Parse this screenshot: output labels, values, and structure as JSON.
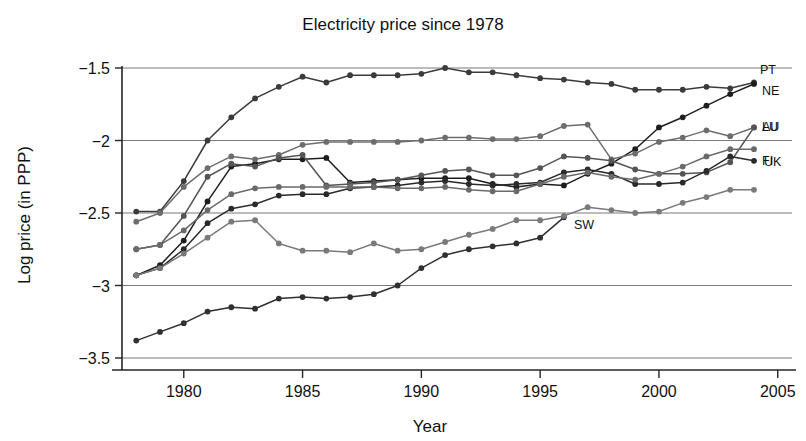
{
  "chart_data": {
    "type": "line",
    "title": "Electricity price since 1978",
    "xlabel": "Year",
    "ylabel": "Log price (in PPP)",
    "xlim": [
      1977.4,
      2005.6
    ],
    "ylim": [
      -3.62,
      -1.46
    ],
    "xticks": [
      1980,
      1985,
      1990,
      1995,
      2000,
      2005
    ],
    "xtick_labels": [
      "1980",
      "1985",
      "1990",
      "1995",
      "2000",
      "2005"
    ],
    "yticks": [
      -1.5,
      -2,
      -2.5,
      -3,
      -3.5
    ],
    "ytick_labels": [
      "−1.5",
      "−2",
      "−2.5",
      "−3",
      "−3.5"
    ],
    "grid": "horizontal",
    "legend_position": "inline-right-end-labels",
    "marker": "filled-circle",
    "series": [
      {
        "name": "PT",
        "label": "PT",
        "color": "#3b3b3b",
        "x": [
          1978,
          1979,
          1980,
          1981,
          1982,
          1983,
          1984,
          1985,
          1986,
          1987,
          1988,
          1989,
          1990,
          1991,
          1992,
          1993,
          1994,
          1995,
          1996,
          1997,
          1998,
          1999,
          2000,
          2001,
          2002,
          2003,
          2004
        ],
        "y": [
          -2.49,
          -2.49,
          -2.28,
          -2.0,
          -1.84,
          -1.71,
          -1.63,
          -1.56,
          -1.6,
          -1.55,
          -1.55,
          -1.55,
          -1.54,
          -1.5,
          -1.53,
          -1.53,
          -1.55,
          -1.57,
          -1.58,
          -1.6,
          -1.61,
          -1.65,
          -1.65,
          -1.65,
          -1.63,
          -1.64,
          -1.6
        ]
      },
      {
        "name": "NE",
        "label": "NE",
        "color": "#1e1e1e",
        "x": [
          1978,
          1979,
          1980,
          1981,
          1982,
          1983,
          1984,
          1985,
          1986,
          1987,
          1988,
          1989,
          1990,
          1991,
          1992,
          1993,
          1994,
          1995,
          1996,
          1997,
          1998,
          1999,
          2000,
          2001,
          2002,
          2003,
          2004
        ],
        "y": [
          -2.93,
          -2.86,
          -2.69,
          -2.42,
          -2.18,
          -2.16,
          -2.13,
          -2.13,
          -2.12,
          -2.29,
          -2.28,
          -2.27,
          -2.26,
          -2.26,
          -2.26,
          -2.3,
          -2.32,
          -2.3,
          -2.31,
          -2.23,
          -2.16,
          -2.06,
          -1.91,
          -1.84,
          -1.76,
          -1.68,
          -1.61
        ]
      },
      {
        "name": "LU",
        "label": "LU",
        "color": "#6d6d6d",
        "x": [
          1978,
          1979,
          1980,
          1981,
          1982,
          1983,
          1984,
          1985,
          1986,
          1987,
          1988,
          1989,
          1990,
          1991,
          1992,
          1993,
          1994,
          1995,
          1996,
          1997,
          1998,
          1999,
          2000,
          2001,
          2002,
          2003,
          2004
        ],
        "y": [
          -2.56,
          -2.5,
          -2.32,
          -2.19,
          -2.11,
          -2.13,
          -2.1,
          -2.03,
          -2.01,
          -2.01,
          -2.01,
          -2.01,
          -2.0,
          -1.98,
          -1.98,
          -1.99,
          -1.99,
          -1.97,
          -1.9,
          -1.89,
          -2.13,
          -2.09,
          -2.01,
          -1.98,
          -1.93,
          -1.97,
          -1.91
        ]
      },
      {
        "name": "AU",
        "label": "AU",
        "color": "#555555",
        "x": [
          1978,
          1979,
          1980,
          1981,
          1982,
          1983,
          1984,
          1985,
          1986,
          1987,
          1988,
          1989,
          1990,
          1991,
          1992,
          1993,
          1994,
          1995,
          1996,
          1997,
          1998,
          1999,
          2000,
          2001,
          2002,
          2003,
          2004
        ],
        "y": [
          -2.75,
          -2.72,
          -2.52,
          -2.25,
          -2.16,
          -2.18,
          -2.12,
          -2.1,
          -2.31,
          -2.3,
          -2.29,
          -2.27,
          -2.24,
          -2.21,
          -2.2,
          -2.24,
          -2.24,
          -2.19,
          -2.11,
          -2.12,
          -2.14,
          -2.2,
          -2.23,
          -2.23,
          -2.22,
          -2.15,
          -1.91
        ]
      },
      {
        "name": "UK",
        "label": "UK",
        "color": "#2a2a2a",
        "x": [
          1978,
          1979,
          1980,
          1981,
          1982,
          1983,
          1984,
          1985,
          1986,
          1987,
          1988,
          1989,
          1990,
          1991,
          1992,
          1993,
          1994,
          1995,
          1996,
          1997,
          1998,
          1999,
          2000,
          2001,
          2002,
          2003,
          2004
        ],
        "y": [
          -2.93,
          -2.88,
          -2.75,
          -2.57,
          -2.47,
          -2.44,
          -2.38,
          -2.37,
          -2.37,
          -2.33,
          -2.32,
          -2.31,
          -2.29,
          -2.28,
          -2.3,
          -2.31,
          -2.3,
          -2.29,
          -2.22,
          -2.2,
          -2.23,
          -2.3,
          -2.3,
          -2.29,
          -2.21,
          -2.11,
          -2.14
        ]
      },
      {
        "name": "FI",
        "label": "FI",
        "color": "#6a6a6a",
        "x": [
          1978,
          1979,
          1980,
          1981,
          1982,
          1983,
          1984,
          1985,
          1986,
          1987,
          1988,
          1989,
          1990,
          1991,
          1992,
          1993,
          1994,
          1995,
          1996,
          1997,
          1998,
          1999,
          2000,
          2001,
          2002,
          2003,
          2004
        ],
        "y": [
          -2.75,
          -2.72,
          -2.62,
          -2.48,
          -2.37,
          -2.33,
          -2.32,
          -2.32,
          -2.32,
          -2.32,
          -2.32,
          -2.33,
          -2.33,
          -2.32,
          -2.34,
          -2.35,
          -2.35,
          -2.3,
          -2.25,
          -2.22,
          -2.25,
          -2.27,
          -2.23,
          -2.18,
          -2.11,
          -2.06,
          -2.06
        ]
      },
      {
        "name": "SW",
        "label": "SW",
        "color": "#303030",
        "x": [
          1978,
          1979,
          1980,
          1981,
          1982,
          1983,
          1984,
          1985,
          1986,
          1987,
          1988,
          1989,
          1990,
          1991,
          1992,
          1993,
          1994,
          1995,
          1996
        ],
        "y": [
          -3.38,
          -3.32,
          -3.26,
          -3.18,
          -3.15,
          -3.16,
          -3.09,
          -3.08,
          -3.09,
          -3.08,
          -3.06,
          -3.0,
          -2.88,
          -2.79,
          -2.75,
          -2.73,
          -2.71,
          -2.67,
          -2.53
        ]
      },
      {
        "name": "series-extra-gray",
        "label": "",
        "color": "#7a7a7a",
        "x": [
          1978,
          1979,
          1980,
          1981,
          1982,
          1983,
          1984,
          1985,
          1986,
          1987,
          1988,
          1989,
          1990,
          1991,
          1992,
          1993,
          1994,
          1995,
          1996,
          1997,
          1998,
          1999,
          2000,
          2001,
          2002,
          2003,
          2004
        ],
        "y": [
          -2.93,
          -2.88,
          -2.78,
          -2.67,
          -2.56,
          -2.55,
          -2.71,
          -2.76,
          -2.76,
          -2.77,
          -2.71,
          -2.76,
          -2.75,
          -2.7,
          -2.65,
          -2.61,
          -2.55,
          -2.55,
          -2.52,
          -2.46,
          -2.48,
          -2.5,
          -2.49,
          -2.43,
          -2.39,
          -2.34,
          -2.34
        ]
      }
    ]
  }
}
